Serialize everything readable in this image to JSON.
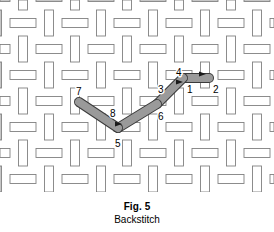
{
  "figure": {
    "caption_label": "Fig. 5",
    "caption_title": "Backstitch"
  },
  "diagram": {
    "name": "basket-weave-fabric-with-backstitch",
    "fabric": {
      "strip_fill": "#ffffff",
      "strip_stroke": "#808080",
      "background": "#ffffff",
      "cell_size": 26,
      "strip_thickness": 9,
      "columns": 10,
      "rows": 7
    },
    "thread": {
      "fill": "#9a9a9a",
      "stroke": "#3a3a3a",
      "width": 8,
      "description": "Backstitch thread shown as rounded gray bars"
    },
    "points": [
      {
        "id": "1",
        "label": "1",
        "x": 183,
        "y": 78,
        "label_x": 187,
        "label_y": 93
      },
      {
        "id": "2",
        "label": "2",
        "x": 209,
        "y": 78,
        "label_x": 213,
        "label_y": 93
      },
      {
        "id": "3",
        "label": "3",
        "x": 157,
        "y": 104,
        "label_x": 158,
        "label_y": 93
      },
      {
        "id": "4",
        "label": "4",
        "x": 183,
        "y": 78,
        "label_x": 176,
        "label_y": 76
      },
      {
        "id": "5",
        "label": "5",
        "x": 118,
        "y": 128,
        "label_x": 115,
        "label_y": 147
      },
      {
        "id": "6",
        "label": "6",
        "x": 157,
        "y": 104,
        "label_x": 158,
        "label_y": 120
      },
      {
        "id": "7",
        "label": "7",
        "x": 79,
        "y": 102,
        "label_x": 76,
        "label_y": 95
      },
      {
        "id": "8",
        "label": "8",
        "x": 118,
        "y": 128,
        "label_x": 110,
        "label_y": 117
      }
    ],
    "segments": [
      {
        "name": "stitch-1-to-2",
        "from": "1",
        "to": "2",
        "x1": 183,
        "y1": 78,
        "x2": 209,
        "y2": 78
      },
      {
        "name": "stitch-3-to-4",
        "from": "3",
        "to": "4",
        "x1": 157,
        "y1": 104,
        "x2": 183,
        "y2": 78
      },
      {
        "name": "stitch-5-to-6",
        "from": "5",
        "to": "6",
        "x1": 118,
        "y1": 128,
        "x2": 157,
        "y2": 104
      },
      {
        "name": "stitch-7-to-8",
        "from": "7",
        "to": "8",
        "x1": 79,
        "y1": 102,
        "x2": 118,
        "y2": 128
      }
    ],
    "arrows": [
      {
        "name": "arrow-at-point-2",
        "x": 203,
        "y": 74
      },
      {
        "name": "arrow-at-point-4",
        "x": 180,
        "y": 82
      },
      {
        "name": "arrow-at-point-8",
        "x": 119,
        "y": 124
      }
    ]
  }
}
